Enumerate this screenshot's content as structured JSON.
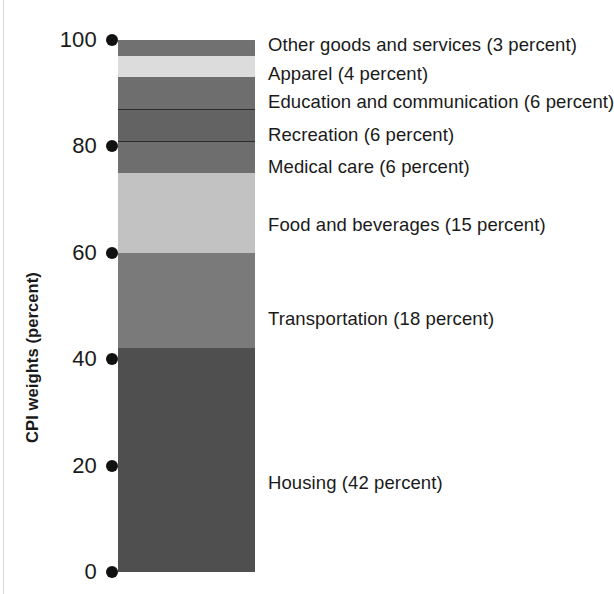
{
  "axis": {
    "title": "CPI weights (percent)",
    "ticks": [
      {
        "value": 100,
        "label": "100"
      },
      {
        "value": 80,
        "label": "80"
      },
      {
        "value": 60,
        "label": "60"
      },
      {
        "value": 40,
        "label": "40"
      },
      {
        "value": 20,
        "label": "20"
      },
      {
        "value": 0,
        "label": "0"
      }
    ]
  },
  "chart_data": {
    "type": "bar",
    "title": "",
    "subtitle": "",
    "xlabel": "",
    "ylabel": "CPI weights (percent)",
    "ylim": [
      0,
      100
    ],
    "grid": false,
    "legend_position": "right-inline",
    "stacked": true,
    "categories": [
      "CPI"
    ],
    "tick_labels": [
      "0",
      "20",
      "40",
      "60",
      "80",
      "100"
    ],
    "series": [
      {
        "name": "Housing",
        "values": [
          42
        ],
        "label": "Housing (42 percent)",
        "percent": 42,
        "color": "#4f4f4f",
        "range": [
          0,
          42
        ]
      },
      {
        "name": "Transportation",
        "values": [
          18
        ],
        "label": "Transportation (18 percent)",
        "percent": 18,
        "color": "#7a7a7a",
        "range": [
          42,
          60
        ]
      },
      {
        "name": "Food and beverages",
        "values": [
          15
        ],
        "label": "Food and beverages (15 percent)",
        "percent": 15,
        "color": "#c2c2c2",
        "range": [
          60,
          75
        ]
      },
      {
        "name": "Medical care",
        "values": [
          6
        ],
        "label": "Medical care (6 percent)",
        "percent": 6,
        "color": "#6e6e6e",
        "range": [
          75,
          81
        ]
      },
      {
        "name": "Recreation",
        "values": [
          6
        ],
        "label": "Recreation (6 percent)",
        "percent": 6,
        "color": "#636363",
        "range": [
          81,
          87
        ]
      },
      {
        "name": "Education and communication",
        "values": [
          6
        ],
        "label": "Education and communication (6 percent)",
        "percent": 6,
        "color": "#6e6e6e",
        "range": [
          87,
          93
        ]
      },
      {
        "name": "Apparel",
        "values": [
          4
        ],
        "label": "Apparel (4 percent)",
        "percent": 4,
        "color": "#dcdcdc",
        "range": [
          93,
          97
        ]
      },
      {
        "name": "Other goods and services",
        "values": [
          3
        ],
        "label": "Other goods and services (3 percent)",
        "percent": 3,
        "color": "#717171",
        "range": [
          97,
          100
        ]
      }
    ],
    "annotations": [
      {
        "text": "Other goods and services (3 percent)"
      },
      {
        "text": "Apparel (4 percent)"
      },
      {
        "text": "Education and communication (6 percent)"
      },
      {
        "text": "Recreation (6 percent)"
      },
      {
        "text": "Medical care (6 percent)"
      },
      {
        "text": "Food and beverages (15 percent)"
      },
      {
        "text": "Transportation (18 percent)"
      },
      {
        "text": "Housing (42 percent)"
      }
    ]
  },
  "callouts": [
    {
      "text": "Other goods and services (3 percent)",
      "top": 36
    },
    {
      "text": "Apparel (4 percent)",
      "top": 65
    },
    {
      "text": "Education and communication (6 percent)",
      "top": 93
    },
    {
      "text": "Recreation (6 percent)",
      "top": 126
    },
    {
      "text": "Medical care (6 percent)",
      "top": 158
    },
    {
      "text": "Food and beverages (15 percent)",
      "top": 216
    },
    {
      "text": "Transportation (18 percent)",
      "top": 310
    },
    {
      "text": "Housing (42 percent)",
      "top": 474
    }
  ]
}
